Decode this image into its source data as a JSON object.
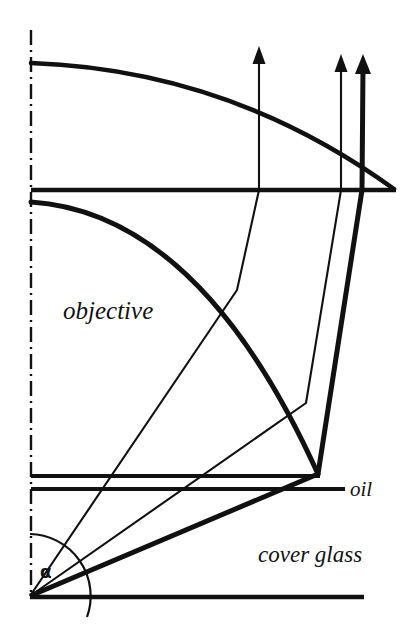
{
  "figure": {
    "kind": "optical-ray-diagram",
    "background_color": "#ffffff",
    "stroke_color": "#111111",
    "width": 404,
    "height": 628
  },
  "labels": {
    "objective": "objective",
    "oil": "oil",
    "cover_glass": "cover glass",
    "alpha": "α"
  },
  "geometry": {
    "optical_axis": {
      "name": "optical-axis",
      "style": "dash-dot",
      "x": 31,
      "y_top": 30,
      "y_bottom": 596
    },
    "object_point": {
      "x": 30,
      "y": 596
    },
    "lens_top_line": {
      "y": 190,
      "x_start": 31,
      "x_end": 396
    },
    "oil_layer_top_line": {
      "y": 476,
      "x_start": 31,
      "x_end": 320
    },
    "oil_layer_bottom_line": {
      "y": 489,
      "x_start": 31,
      "x_end": 345
    },
    "specimen_plane_line": {
      "y": 597,
      "x_start": 30,
      "x_end": 364
    },
    "lens_surfaces": [
      {
        "name": "upper-lens-surface",
        "start": [
          31,
          63
        ],
        "end": [
          394,
          189
        ]
      },
      {
        "name": "lower-lens-surface",
        "start": [
          31,
          202
        ],
        "end": [
          318,
          474
        ]
      }
    ],
    "marginal_ray": {
      "name": "marginal-ray",
      "weight": "thick",
      "points": [
        [
          30,
          596
        ],
        [
          318,
          474
        ],
        [
          362,
          190
        ],
        [
          363,
          56
        ]
      ]
    },
    "inner_rays": [
      {
        "name": "inner-ray-1",
        "weight": "thin",
        "points": [
          [
            30,
            596
          ],
          [
            237,
            290
          ],
          [
            259,
            190
          ],
          [
            259,
            48
          ]
        ]
      },
      {
        "name": "inner-ray-2",
        "weight": "thin",
        "points": [
          [
            30,
            596
          ],
          [
            306,
            403
          ],
          [
            341,
            190
          ],
          [
            341,
            56
          ]
        ]
      }
    ],
    "arrows": [
      {
        "name": "arrow-ray-1",
        "x": 259,
        "tip_y": 48,
        "weight": "thin"
      },
      {
        "name": "arrow-ray-2",
        "x": 341,
        "tip_y": 56,
        "weight": "thin"
      },
      {
        "name": "arrow-marginal-ray",
        "x": 363,
        "tip_y": 56,
        "weight": "thick"
      }
    ],
    "aperture_angle_arc": {
      "name": "aperture-angle-arc",
      "center": [
        30,
        596
      ],
      "radius": 62,
      "from_deg": 270,
      "to_deg": 337
    }
  },
  "label_positions": {
    "objective": {
      "x": 63,
      "y": 319
    },
    "oil": {
      "x": 350,
      "y": 496
    },
    "cover_glass": {
      "x": 258,
      "y": 562
    },
    "alpha": {
      "x": 40,
      "y": 578
    }
  }
}
